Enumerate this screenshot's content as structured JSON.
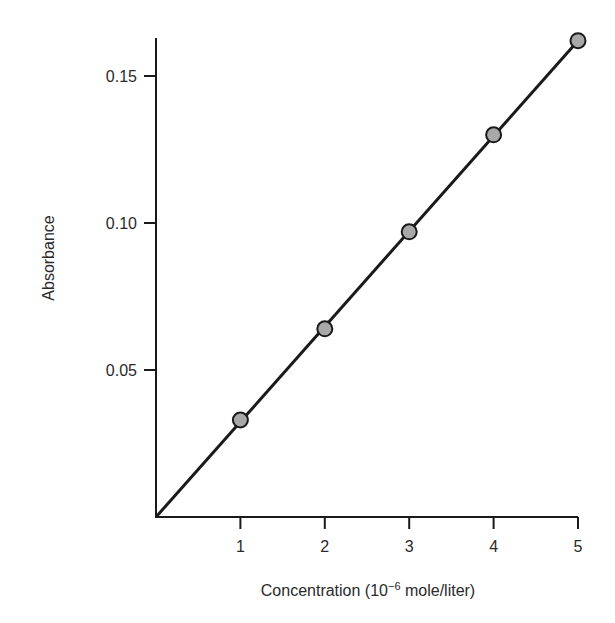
{
  "chart_data": {
    "type": "scatter",
    "title": "",
    "xlabel": "Concentration (10⁻⁶ mole/liter)",
    "xlabel_parts": {
      "prefix": "Concentration (10",
      "sup": "−6",
      "suffix": " mole/liter)"
    },
    "ylabel": "Absorbance",
    "x": [
      1,
      2,
      3,
      4,
      5
    ],
    "series": [
      {
        "name": "Absorbance",
        "values": [
          0.033,
          0.064,
          0.097,
          0.13,
          0.162
        ],
        "marker": "circle",
        "marker_fill": "#a8a8a8",
        "marker_edge": "#1a1a1a"
      }
    ],
    "fit_line": {
      "type": "linear",
      "from": [
        0,
        0
      ],
      "to": [
        5,
        0.162
      ],
      "color": "#1a1a1a"
    },
    "xlim": [
      0,
      5
    ],
    "ylim": [
      0,
      0.163
    ],
    "xticks": [
      "1",
      "2",
      "3",
      "4",
      "5"
    ],
    "yticks": [
      "0.05",
      "0.10",
      "0.15"
    ],
    "ytick_values": [
      0.05,
      0.1,
      0.15
    ],
    "grid": false,
    "legend": null
  }
}
